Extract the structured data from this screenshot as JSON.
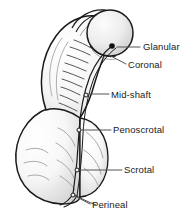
{
  "figure": {
    "style": "grayscale line drawing with leader-line callouts",
    "background_color": "#ffffff",
    "outline_color": "#1a1a1a",
    "fill_color": "#f2f2f2",
    "shade_color": "#d8d8d8",
    "leader_color": "#555555",
    "text_color": "#1a1a1a"
  },
  "labels": [
    {
      "id": "glanular",
      "text": "Glanular",
      "text_x": 143,
      "text_y": 41,
      "leader": {
        "x1": 132,
        "y1": 47,
        "x2": 118,
        "y2": 47
      },
      "marker": {
        "x": 112,
        "y": 46,
        "r": 2.6,
        "type": "meatus-dot"
      }
    },
    {
      "id": "coronal",
      "text": "Coronal",
      "text_x": 128,
      "text_y": 59,
      "leader": {
        "x1": 126,
        "y1": 65,
        "x2": 108,
        "y2": 56
      },
      "marker": {
        "x": 106,
        "y": 55,
        "r": 0,
        "type": "tick"
      }
    },
    {
      "id": "mid-shaft",
      "text": "Mid-shaft",
      "text_x": 111,
      "text_y": 89,
      "leader": {
        "x1": 108,
        "y1": 95,
        "x2": 88,
        "y2": 95
      },
      "marker": {
        "x": 86,
        "y": 95,
        "r": 2.0,
        "type": "meatus-dot"
      }
    },
    {
      "id": "penoscrotal",
      "text": "Penoscrotal",
      "text_x": 113,
      "text_y": 124,
      "leader": {
        "x1": 111,
        "y1": 130,
        "x2": 80,
        "y2": 130
      },
      "marker": {
        "x": 79,
        "y": 130,
        "r": 2.0,
        "type": "meatus-dot"
      }
    },
    {
      "id": "scrotal",
      "text": "Scrotal",
      "text_x": 124,
      "text_y": 164,
      "leader": {
        "x1": 122,
        "y1": 170,
        "x2": 78,
        "y2": 170
      },
      "marker": {
        "x": 77,
        "y": 170,
        "r": 2.0,
        "type": "meatus-dot"
      }
    },
    {
      "id": "perineal",
      "text": "Perineal",
      "text_x": 92,
      "text_y": 199,
      "leader": {
        "x1": 90,
        "y1": 205,
        "x2": 74,
        "y2": 196
      },
      "marker": {
        "x": 73,
        "y": 195,
        "r": 2.0,
        "type": "meatus-dot"
      }
    }
  ]
}
